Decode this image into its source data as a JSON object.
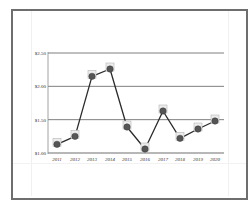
{
  "chart_data": {
    "type": "line",
    "title": "",
    "xlabel": "",
    "ylabel": "",
    "categories": [
      "2011",
      "2012",
      "2013",
      "2014",
      "2015",
      "2016",
      "2017",
      "2018",
      "2019",
      "2020"
    ],
    "series": [
      {
        "name": "Price",
        "values": [
          1.13,
          1.25,
          2.15,
          2.26,
          1.39,
          1.06,
          1.63,
          1.22,
          1.36,
          1.48
        ],
        "color": "#2b2b2b",
        "marker": "circle"
      }
    ],
    "ylim": [
      1.0,
      2.5
    ],
    "yticks": [
      1.0,
      1.5,
      2.0,
      2.5
    ],
    "ytick_labels": [
      "$1.00",
      "$1.50",
      "$2.00",
      "$2.50"
    ],
    "grid": {
      "horizontal": true,
      "vertical": false
    },
    "legend": null
  },
  "axis": {
    "y_labels": [
      "$2.50",
      "$2.00",
      "$1.50",
      "$1.00"
    ],
    "x_labels": [
      "2011",
      "2012",
      "2013",
      "2014",
      "2015",
      "2016",
      "2017",
      "2018",
      "2019",
      "2020"
    ]
  },
  "colors": {
    "frame": "#6e6e6e",
    "gridline": "#707070",
    "line": "#2b2b2b",
    "marker_fill": "#555555",
    "marker_box": "#b5b5b5"
  }
}
